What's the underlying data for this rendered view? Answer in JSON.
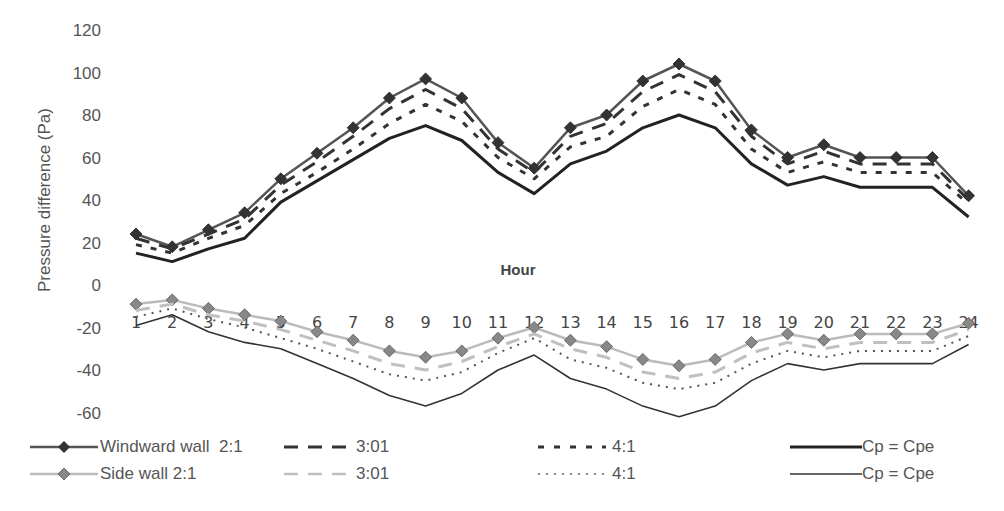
{
  "chart_data": {
    "type": "line",
    "title": "",
    "xlabel": "Hour",
    "ylabel": "Pressure difference (Pa)",
    "ylim": [
      -60,
      120
    ],
    "yticks": [
      120,
      100,
      80,
      60,
      40,
      20,
      0,
      -20,
      -40,
      -60
    ],
    "grid": false,
    "legend_position": "bottom",
    "categories": [
      "1",
      "2",
      "3",
      "4",
      "5",
      "6",
      "7",
      "8",
      "9",
      "10",
      "11",
      "12",
      "13",
      "14",
      "15",
      "16",
      "17",
      "18",
      "19",
      "20",
      "21",
      "22",
      "23",
      "24"
    ],
    "series": [
      {
        "name": "Windward wall 2:1",
        "color": "#555555",
        "marker": "diamond",
        "marker_color": "#333333",
        "dash": "solid",
        "width": 2.5,
        "values": [
          24,
          18,
          26,
          34,
          50,
          62,
          74,
          88,
          97,
          88,
          67,
          55,
          74,
          80,
          96,
          104,
          96,
          73,
          60,
          66,
          60,
          60,
          60,
          42
        ]
      },
      {
        "name": "3:01",
        "color": "#333333",
        "marker": "none",
        "dash": "long-dash",
        "width": 3,
        "values": [
          22,
          17,
          24,
          31,
          47,
          58,
          70,
          83,
          92,
          83,
          64,
          53,
          70,
          76,
          91,
          99,
          91,
          70,
          57,
          63,
          57,
          57,
          57,
          40
        ]
      },
      {
        "name": "4:1",
        "color": "#333333",
        "marker": "none",
        "dash": "dash",
        "width": 3,
        "values": [
          19,
          15,
          22,
          28,
          43,
          53,
          64,
          76,
          85,
          77,
          60,
          50,
          65,
          70,
          84,
          92,
          85,
          64,
          53,
          58,
          53,
          53,
          53,
          38
        ]
      },
      {
        "name": "Cp = Cpe",
        "color": "#222222",
        "marker": "none",
        "dash": "solid",
        "width": 3,
        "values": [
          15,
          11,
          17,
          22,
          39,
          49,
          59,
          69,
          75,
          68,
          53,
          43,
          57,
          63,
          74,
          80,
          74,
          57,
          47,
          51,
          46,
          46,
          46,
          32
        ]
      },
      {
        "name": "Side wall 2:1",
        "color": "#bbbbbb",
        "marker": "diamond",
        "marker_color": "#888888",
        "dash": "solid",
        "width": 2.5,
        "values": [
          -9,
          -7,
          -11,
          -14,
          -17,
          -22,
          -26,
          -31,
          -34,
          -31,
          -25,
          -20,
          -26,
          -29,
          -35,
          -38,
          -35,
          -27,
          -23,
          -26,
          -23,
          -23,
          -23,
          -18
        ]
      },
      {
        "name": "3:01",
        "color": "#c0c0c0",
        "marker": "none",
        "dash": "long-dash",
        "width": 3,
        "values": [
          -12,
          -9,
          -14,
          -17,
          -21,
          -26,
          -31,
          -37,
          -40,
          -36,
          -29,
          -23,
          -30,
          -34,
          -41,
          -44,
          -41,
          -32,
          -27,
          -30,
          -27,
          -27,
          -27,
          -21
        ]
      },
      {
        "name": "4:1",
        "color": "#555555",
        "marker": "none",
        "dash": "dot",
        "width": 2,
        "values": [
          -15,
          -11,
          -16,
          -20,
          -25,
          -30,
          -36,
          -42,
          -45,
          -41,
          -32,
          -25,
          -35,
          -39,
          -46,
          -49,
          -46,
          -37,
          -31,
          -34,
          -31,
          -31,
          -31,
          -24
        ]
      },
      {
        "name": "Cp = Cpe",
        "color": "#333333",
        "marker": "none",
        "dash": "solid",
        "width": 1.6,
        "values": [
          -19,
          -14,
          -22,
          -27,
          -30,
          -37,
          -44,
          -52,
          -57,
          -51,
          -40,
          -33,
          -44,
          -49,
          -57,
          -62,
          -57,
          -45,
          -37,
          -40,
          -37,
          -37,
          -37,
          -28
        ]
      }
    ]
  },
  "legend": {
    "row1": [
      {
        "label": "Windward wall  2:1"
      },
      {
        "label": "3:01"
      },
      {
        "label": "4:1"
      },
      {
        "label": "Cp = Cpe"
      }
    ],
    "row2": [
      {
        "label": "Side wall 2:1"
      },
      {
        "label": "3:01"
      },
      {
        "label": "4:1"
      },
      {
        "label": "Cp = Cpe"
      }
    ]
  }
}
